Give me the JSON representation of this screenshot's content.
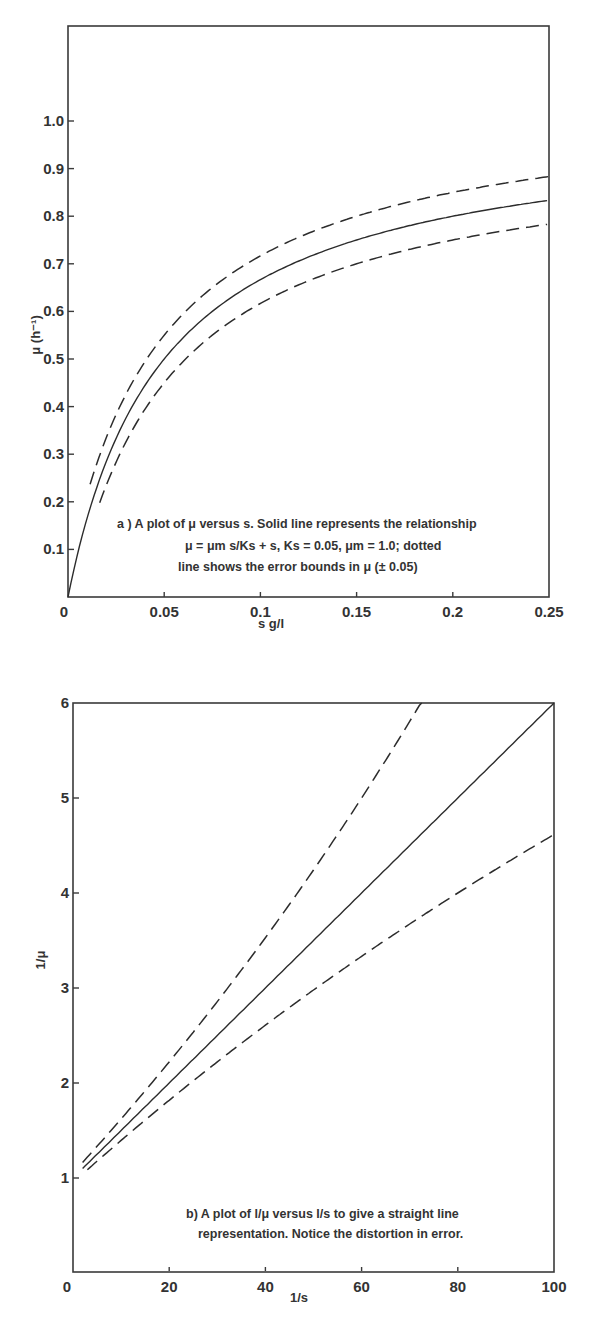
{
  "chart_data": [
    {
      "type": "line",
      "panel": "a",
      "title": "",
      "xlabel": "s  g/l",
      "ylabel": "μ (h⁻¹)",
      "xlim": [
        0,
        0.25
      ],
      "ylim": [
        0,
        1.1
      ],
      "grid": false,
      "x_ticks": [
        "0",
        "0.05",
        "0.1",
        "0.15",
        "0.2",
        "0.25"
      ],
      "y_ticks": [
        "0.1",
        "0.2",
        "0.3",
        "0.4",
        "0.5",
        "0.6",
        "0.7",
        "0.8",
        "0.9",
        "1.0"
      ],
      "caption_lines": [
        "a ) A plot of μ versus s.  Solid line represents the relationship",
        "μ = μm s/Ks + s, Ks = 0.05, μm = 1.0; dotted",
        "line shows the error bounds in μ (± 0.05)"
      ],
      "parameters": {
        "Ks": 0.05,
        "mu_m": 1.0,
        "error": 0.05
      },
      "x": [
        0,
        0.01,
        0.02,
        0.03,
        0.05,
        0.075,
        0.1,
        0.15,
        0.2,
        0.25
      ],
      "series": [
        {
          "name": "μ = μm·s/(Ks+s)",
          "style": "solid",
          "values": [
            0.0,
            0.167,
            0.286,
            0.375,
            0.5,
            0.6,
            0.667,
            0.75,
            0.8,
            0.833
          ]
        },
        {
          "name": "upper error bound (+0.05)",
          "style": "dashed",
          "values": [
            null,
            0.217,
            0.336,
            0.425,
            0.55,
            0.65,
            0.717,
            0.8,
            0.85,
            0.883
          ]
        },
        {
          "name": "lower error bound (-0.05)",
          "style": "dashed",
          "values": [
            null,
            null,
            0.236,
            0.325,
            0.45,
            0.55,
            0.617,
            0.7,
            0.75,
            0.783
          ]
        }
      ]
    },
    {
      "type": "line",
      "panel": "b",
      "title": "",
      "xlabel": "1/s",
      "ylabel": "1/μ",
      "xlim": [
        0,
        100
      ],
      "ylim": [
        0,
        6
      ],
      "grid": false,
      "x_ticks": [
        "0",
        "20",
        "40",
        "60",
        "80",
        "100"
      ],
      "y_ticks": [
        "1",
        "2",
        "3",
        "4",
        "5",
        "6"
      ],
      "caption_lines": [
        "b) A plot of l/μ versus l/s to give a straight line",
        "representation. Notice the distortion in error."
      ],
      "x": [
        2,
        10,
        20,
        40,
        60,
        72,
        80,
        100
      ],
      "series": [
        {
          "name": "1/μ (solid)",
          "style": "solid",
          "values": [
            1.1,
            1.5,
            2.0,
            3.0,
            4.0,
            4.6,
            5.0,
            6.0
          ]
        },
        {
          "name": "1/(μ-0.05) upper",
          "style": "dashed",
          "values": [
            1.16,
            1.71,
            2.5,
            4.62,
            8.0,
            6.0,
            null,
            null
          ]
        },
        {
          "name": "1/(μ+0.05) lower",
          "style": "dashed",
          "values": [
            1.05,
            1.33,
            1.67,
            2.31,
            2.86,
            3.15,
            3.33,
            4.62
          ]
        }
      ]
    }
  ],
  "panel_a": {
    "y_axis_title": "μ (h⁻¹)",
    "x_axis_title": "s  g/l",
    "x_tick_labels": [
      "0",
      "0.05",
      "0.1",
      "0.15",
      "0.2",
      "0.25"
    ],
    "y_tick_labels": [
      "0.1",
      "0.2",
      "0.3",
      "0.4",
      "0.5",
      "0.6",
      "0.7",
      "0.8",
      "0.9",
      "1.0"
    ],
    "caption_line1": "a ) A plot of μ versus s.  Solid line represents the relationship",
    "caption_line2": "μ = μm s/Ks + s, Ks = 0.05, μm = 1.0; dotted",
    "caption_line3": "line shows the error bounds in μ (± 0.05)"
  },
  "panel_b": {
    "y_axis_title": "1/μ",
    "x_axis_title": "1/s",
    "x_tick_labels": [
      "0",
      "20",
      "40",
      "60",
      "80",
      "100"
    ],
    "y_tick_labels": [
      "1",
      "2",
      "3",
      "4",
      "5",
      "6"
    ],
    "caption_line1": "b) A plot of l/μ versus l/s to give a straight line",
    "caption_line2": "representation. Notice the distortion in error."
  }
}
